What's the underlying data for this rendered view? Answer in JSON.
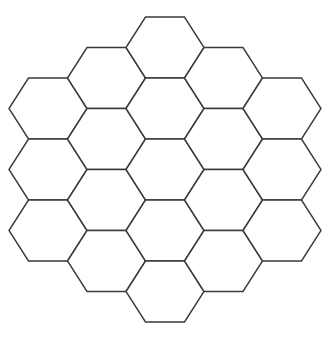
{
  "figure": {
    "background_color": "#ffffff",
    "stroke_color": "#3a3a3a",
    "fill_color": "#ffffff",
    "stroke_width": 1.4,
    "canvas_width": 328,
    "canvas_height": 339
  },
  "chart_data": {
    "type": "diagram",
    "shape": "hexagonal-honeycomb",
    "orientation": "flat-top",
    "rings": 2,
    "cell_count": 19,
    "hex_width": 78,
    "hex_height": 61,
    "hex_radius": 39,
    "column_spacing": 58.5,
    "row_spacing": 61,
    "row_offset": 30.5,
    "origin_x": 165,
    "origin_y": 169.5,
    "columns": [
      {
        "index": -2,
        "cells": 3,
        "center_x": 48,
        "start_y": 108.5
      },
      {
        "index": -1,
        "cells": 4,
        "center_x": 106.5,
        "start_y": 78
      },
      {
        "index": 0,
        "cells": 5,
        "center_x": 165,
        "start_y": 47.5
      },
      {
        "index": 1,
        "cells": 4,
        "center_x": 223.5,
        "start_y": 78
      },
      {
        "index": 2,
        "cells": 3,
        "center_x": 282,
        "start_y": 108.5
      }
    ],
    "cells": [
      {
        "id": "c0",
        "q": -2,
        "r": 0,
        "cx": 48,
        "cy": 108.5
      },
      {
        "id": "c1",
        "q": -2,
        "r": 1,
        "cx": 48,
        "cy": 169.5
      },
      {
        "id": "c2",
        "q": -2,
        "r": 2,
        "cx": 48,
        "cy": 230.5
      },
      {
        "id": "c3",
        "q": -1,
        "r": 0,
        "cx": 106.5,
        "cy": 78
      },
      {
        "id": "c4",
        "q": -1,
        "r": 1,
        "cx": 106.5,
        "cy": 139
      },
      {
        "id": "c5",
        "q": -1,
        "r": 2,
        "cx": 106.5,
        "cy": 200
      },
      {
        "id": "c6",
        "q": -1,
        "r": 3,
        "cx": 106.5,
        "cy": 261
      },
      {
        "id": "c7",
        "q": 0,
        "r": 0,
        "cx": 165,
        "cy": 47.5
      },
      {
        "id": "c8",
        "q": 0,
        "r": 1,
        "cx": 165,
        "cy": 108.5
      },
      {
        "id": "c9",
        "q": 0,
        "r": 2,
        "cx": 165,
        "cy": 169.5
      },
      {
        "id": "c10",
        "q": 0,
        "r": 3,
        "cx": 165,
        "cy": 230.5
      },
      {
        "id": "c11",
        "q": 0,
        "r": 4,
        "cx": 165,
        "cy": 291.5
      },
      {
        "id": "c12",
        "q": 1,
        "r": 0,
        "cx": 223.5,
        "cy": 78
      },
      {
        "id": "c13",
        "q": 1,
        "r": 1,
        "cx": 223.5,
        "cy": 139
      },
      {
        "id": "c14",
        "q": 1,
        "r": 2,
        "cx": 223.5,
        "cy": 200
      },
      {
        "id": "c15",
        "q": 1,
        "r": 3,
        "cx": 223.5,
        "cy": 261
      },
      {
        "id": "c16",
        "q": 2,
        "r": 0,
        "cx": 282,
        "cy": 108.5
      },
      {
        "id": "c17",
        "q": 2,
        "r": 1,
        "cx": 282,
        "cy": 169.5
      },
      {
        "id": "c18",
        "q": 2,
        "r": 2,
        "cx": 282,
        "cy": 230.5
      }
    ]
  }
}
